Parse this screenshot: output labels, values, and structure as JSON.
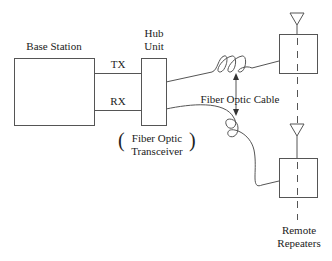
{
  "diagram": {
    "base_station": {
      "label": "Base Station"
    },
    "hub_unit": {
      "label_line1": "Hub",
      "label_line2": "Unit"
    },
    "tx_label": "TX",
    "rx_label": "RX",
    "transceiver": {
      "line1": "Fiber Optic",
      "line2": "Transceiver",
      "open_paren": "(",
      "close_paren": ")"
    },
    "cable_label": "Fiber Optic Cable",
    "remote": {
      "line1": "Remote",
      "line2": "Repeaters"
    },
    "colors": {
      "stroke": "#555555",
      "text": "#222222",
      "background": "#ffffff"
    }
  }
}
